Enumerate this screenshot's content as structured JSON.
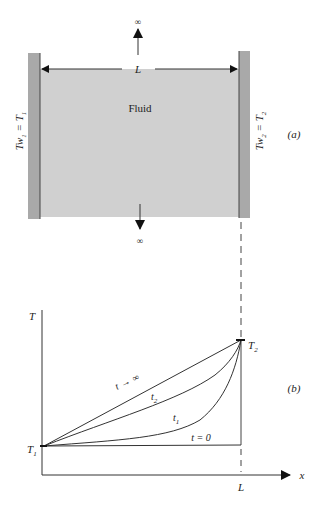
{
  "panel_a": {
    "fluid_label": "Fluid",
    "width_label": "L",
    "top_arrow_label": "∞",
    "bottom_arrow_label": "∞",
    "left_wall_label_main": "Tw",
    "left_wall_label_sub": "1",
    "left_wall_label_eq": " = T",
    "left_wall_label_sub2": "1",
    "right_wall_label_main": "Tw",
    "right_wall_label_sub": "2",
    "right_wall_label_eq": " = T",
    "right_wall_label_sub2": "2",
    "panel_tag": "(a)",
    "colors": {
      "fluid": "#d0d0d0",
      "wall": "#a9a9a9",
      "wall_edge": "#444444"
    }
  },
  "panel_b": {
    "y_axis_label": "T",
    "x_axis_label": "x",
    "x_end_label": "L",
    "t1_point_label": "T",
    "t1_point_sub": "1",
    "t2_point_label": "T",
    "t2_point_sub": "2",
    "curve_labels": {
      "t_inf": "t",
      "t_inf_arrow": "→",
      "t_inf_value": "∞",
      "t2": "t",
      "t2_sub": "2",
      "t1": "t",
      "t1_sub": "1",
      "t0": "t = 0"
    },
    "panel_tag": "(b)"
  }
}
